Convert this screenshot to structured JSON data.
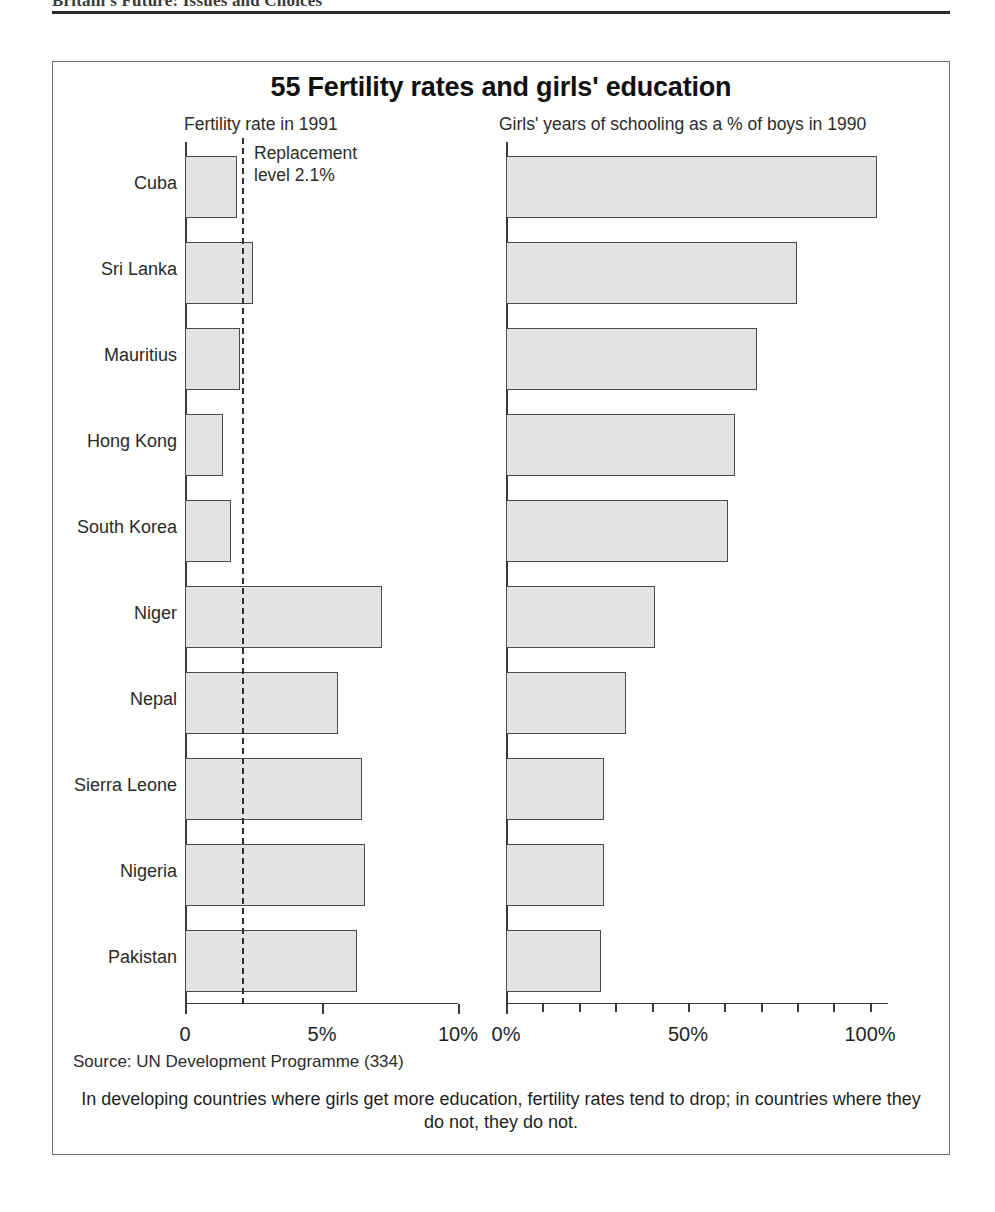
{
  "running_head": "Britain's Future: Issues and Choices",
  "figure": {
    "title": "55 Fertility rates and girls' education",
    "source": "Source: UN Development Programme (334)",
    "caption": "In developing countries where girls get more education, fertility rates tend to drop; in countries where they do not, they do not.",
    "annotation": {
      "line1": "Replacement",
      "line2": "level 2.1%"
    }
  },
  "chart_data": {
    "type": "bar",
    "orientation": "horizontal",
    "title": "55 Fertility rates and girls' education",
    "categories": [
      "Cuba",
      "Sri Lanka",
      "Mauritius",
      "Hong Kong",
      "South Korea",
      "Niger",
      "Nepal",
      "Sierra Leone",
      "Nigeria",
      "Pakistan"
    ],
    "panels": [
      {
        "id": "fertility",
        "heading": "Fertility rate in 1991",
        "xlabel": "",
        "ylabel": "",
        "xlim": [
          0,
          10
        ],
        "ticks": [
          {
            "value": 0,
            "label": "0",
            "major": true
          },
          {
            "value": 5,
            "label": "5%",
            "major": true
          },
          {
            "value": 10,
            "label": "10%",
            "major": true
          }
        ],
        "reference_line": {
          "value": 2.1,
          "label": "Replacement level 2.1%",
          "style": "dashed"
        },
        "values": [
          1.9,
          2.5,
          2.0,
          1.4,
          1.7,
          7.2,
          5.6,
          6.5,
          6.6,
          6.3
        ],
        "grid": false
      },
      {
        "id": "schooling",
        "heading": "Girls' years of schooling as a % of boys in 1990",
        "xlabel": "",
        "ylabel": "",
        "xlim": [
          0,
          105
        ],
        "ticks": [
          {
            "value": 0,
            "label": "0%",
            "major": true
          },
          {
            "value": 10,
            "label": "",
            "major": false
          },
          {
            "value": 20,
            "label": "",
            "major": false
          },
          {
            "value": 30,
            "label": "",
            "major": false
          },
          {
            "value": 40,
            "label": "",
            "major": false
          },
          {
            "value": 50,
            "label": "50%",
            "major": false
          },
          {
            "value": 60,
            "label": "",
            "major": false
          },
          {
            "value": 70,
            "label": "",
            "major": false
          },
          {
            "value": 80,
            "label": "",
            "major": false
          },
          {
            "value": 90,
            "label": "",
            "major": false
          },
          {
            "value": 100,
            "label": "100%",
            "major": false
          }
        ],
        "values": [
          102,
          80,
          69,
          63,
          61,
          41,
          33,
          27,
          27,
          26
        ],
        "grid": false
      }
    ],
    "colors": {
      "bar_fill": "#e3e3e3",
      "bar_border": "#4a4a4a",
      "axis": "#3a3a3a",
      "reference_line": "#2f2f2f",
      "frame": "#6b6b6b"
    }
  }
}
